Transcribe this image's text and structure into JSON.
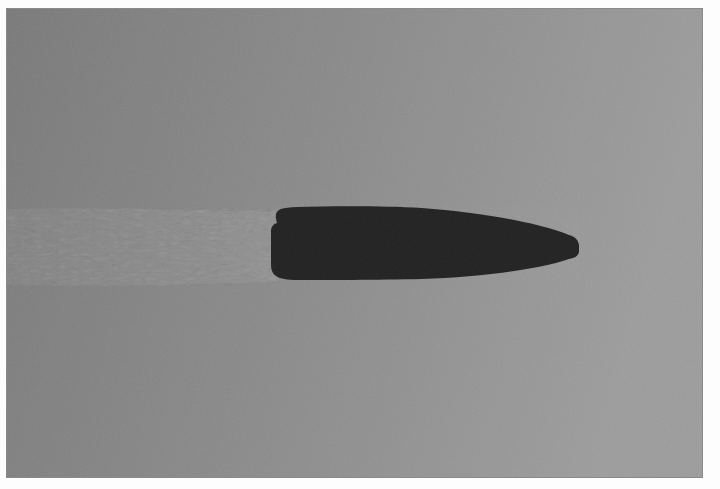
{
  "image": {
    "subject": "Shadowgraph of a bullet in flight",
    "description": "High-speed shadowgraph photograph showing a dark bullet silhouette traveling right with a turbulent wake trailing to the left on a gray background",
    "colors": {
      "border": "#ffffff",
      "background_left": "#7b7b7b",
      "background_right": "#9b9b9b",
      "bullet": "#242424",
      "wake": "#8c8c8c"
    },
    "elements": [
      {
        "name": "bullet-silhouette",
        "bbox": [
          269,
          206,
          578,
          279
        ]
      },
      {
        "name": "turbulent-wake",
        "bbox": [
          6,
          205,
          275,
          285
        ]
      }
    ]
  }
}
